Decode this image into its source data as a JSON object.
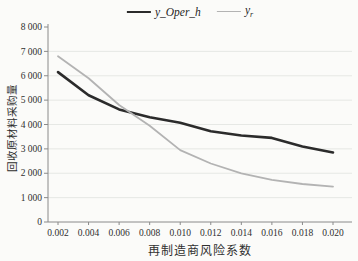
{
  "chart_data": {
    "type": "line",
    "title": "",
    "x": [
      0.002,
      0.004,
      0.006,
      0.008,
      0.01,
      0.012,
      0.014,
      0.016,
      0.018,
      0.02
    ],
    "x_tick_labels": [
      "0.002",
      "0.004",
      "0.006",
      "0.008",
      "0.010",
      "0.012",
      "0.014",
      "0.016",
      "0.018",
      "0.020"
    ],
    "series": [
      {
        "name": "y_Oper_h",
        "legend_label": "y_Oper_h",
        "color": "#2b2b2b",
        "line_width": 2.6,
        "values": [
          6150,
          5200,
          4620,
          4300,
          4075,
          3720,
          3550,
          3450,
          3100,
          2850
        ]
      },
      {
        "name": "y_r",
        "legend_label": "y",
        "legend_sub": "r",
        "color": "#b3b3b3",
        "line_width": 1.8,
        "values": [
          6800,
          5900,
          4800,
          3950,
          2950,
          2400,
          2000,
          1730,
          1560,
          1450
        ]
      }
    ],
    "xlabel": "再制造商风险系数",
    "ylabel": "回收原材料采购量",
    "ylim": [
      0,
      8000
    ],
    "ytick_step": 1000,
    "ytick_labels": [
      "0",
      "1 000",
      "2 000",
      "3 000",
      "4 000",
      "5 000",
      "6 000",
      "7 000",
      "8 000"
    ],
    "grid": "horizontal",
    "legend_position": "top-center",
    "colors": {
      "grid": "#e3e5e2",
      "axis": "#8a8a8a",
      "text": "#2f2f2f",
      "background": "#fbfbf9"
    }
  }
}
